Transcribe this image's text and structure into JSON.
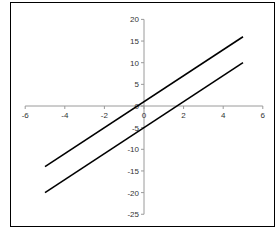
{
  "chart_data": {
    "type": "line",
    "title": "",
    "xlabel": "",
    "ylabel": "",
    "xlim": [
      -6,
      6
    ],
    "ylim": [
      -25,
      20
    ],
    "grid": false,
    "legend": null,
    "x_ticks": [
      -6,
      -4,
      -2,
      0,
      2,
      4,
      6
    ],
    "y_ticks": [
      20,
      15,
      10,
      5,
      0,
      -5,
      -10,
      -15,
      -20,
      -25
    ],
    "x_tick_labels": [
      "-6",
      "-4",
      "-2",
      "0",
      "2",
      "4",
      "6"
    ],
    "y_tick_labels": [
      "20",
      "15",
      "10",
      "5",
      "0",
      "-5",
      "-10",
      "-15",
      "-20",
      "-25"
    ],
    "series": [
      {
        "name": "upper line",
        "x": [
          -5,
          5
        ],
        "values": [
          -14,
          16
        ],
        "color": "#000000"
      },
      {
        "name": "lower line",
        "x": [
          -5,
          5
        ],
        "values": [
          -20,
          10
        ],
        "color": "#000000"
      }
    ]
  },
  "colors": {
    "axis": "#9a9a9a",
    "line": "#000000",
    "frame": "#000000"
  }
}
